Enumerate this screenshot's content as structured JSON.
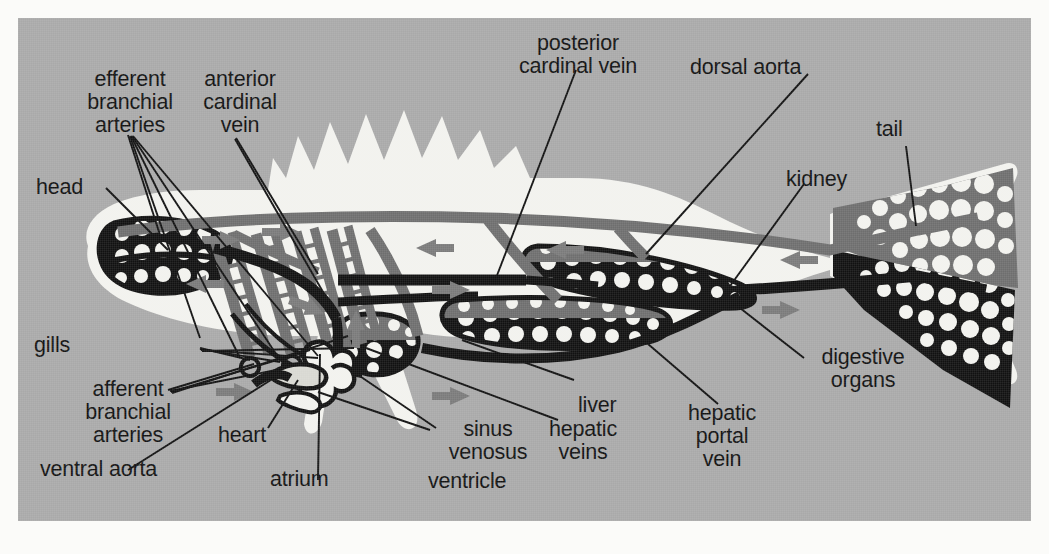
{
  "figure": {
    "panel_bg": "#a9a9a9",
    "body_fill": "#f2f2ee",
    "artery_color": "#6e6e6e",
    "vein_color": "#111111",
    "arrow_color": "#7a7a7a"
  },
  "labels": {
    "efferent_branchial_arteries": "efferent\nbranchial\narteries",
    "anterior_cardinal_vein": "anterior\ncardinal\nvein",
    "posterior_cardinal_vein": "posterior\ncardinal vein",
    "dorsal_aorta": "dorsal aorta",
    "kidney": "kidney",
    "tail": "tail",
    "head": "head",
    "gills": "gills",
    "afferent_branchial_arteries": "afferent\nbranchial\narteries",
    "ventral_aorta": "ventral aorta",
    "heart": "heart",
    "atrium": "atrium",
    "sinus_venosus": "sinus\nvenosus",
    "ventricle": "ventricle",
    "hepatic_veins": "hepatic\nveins",
    "liver": "liver",
    "hepatic_portal_vein": "hepatic\nportal\nvein",
    "digestive_organs": "digestive\norgans"
  }
}
